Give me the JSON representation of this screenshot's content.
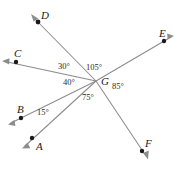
{
  "figure": {
    "type": "geometry-angle-diagram",
    "width": 175,
    "height": 169,
    "background_color": "#ffffff",
    "line_color": "#8c8c8c",
    "dot_color": "#1a1a1a",
    "text_color": "#1a1a1a"
  },
  "vertex": {
    "label": "G",
    "x": 96,
    "y": 81,
    "label_x": 101,
    "label_y": 76
  },
  "points": [
    {
      "label": "A",
      "dot_x": 32,
      "dot_y": 138,
      "label_x": 36,
      "label_y": 141,
      "tip_x": 22,
      "tip_y": 148
    },
    {
      "label": "B",
      "dot_x": 21,
      "dot_y": 118,
      "label_x": 17,
      "label_y": 104,
      "tip_x": 8,
      "tip_y": 124
    },
    {
      "label": "C",
      "dot_x": 16,
      "dot_y": 62,
      "label_x": 14,
      "label_y": 48,
      "tip_x": 2,
      "tip_y": 61
    },
    {
      "label": "D",
      "dot_x": 38,
      "dot_y": 22,
      "label_x": 41,
      "label_y": 10,
      "tip_x": 31,
      "tip_y": 14
    },
    {
      "label": "E",
      "dot_x": 164,
      "dot_y": 41,
      "label_x": 159,
      "label_y": 28,
      "tip_x": 174,
      "tip_y": 36
    },
    {
      "label": "F",
      "dot_x": 142,
      "dot_y": 151,
      "label_x": 145,
      "label_y": 138,
      "tip_x": 148,
      "tip_y": 159
    }
  ],
  "angles": [
    {
      "name": "angle-CGD",
      "value": "30°",
      "x": 58,
      "y": 62
    },
    {
      "name": "angle-DGE",
      "value": "105°",
      "x": 86,
      "y": 63
    },
    {
      "name": "angle-CGB",
      "value": "40°",
      "x": 63,
      "y": 78
    },
    {
      "name": "angle-EGF",
      "value": "85°",
      "x": 112,
      "y": 82
    },
    {
      "name": "angle-AGF",
      "value": "75°",
      "x": 82,
      "y": 93
    },
    {
      "name": "angle-BGA",
      "value": "15°",
      "x": 37,
      "y": 108
    }
  ]
}
